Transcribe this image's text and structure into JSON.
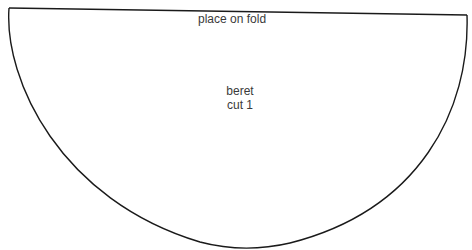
{
  "pattern": {
    "fold_label": "place on fold",
    "piece_name": "beret",
    "cut_instruction": "cut 1",
    "outline_color": "#1a1a1a",
    "text_color": "#3a3a3a",
    "background": "#ffffff"
  }
}
